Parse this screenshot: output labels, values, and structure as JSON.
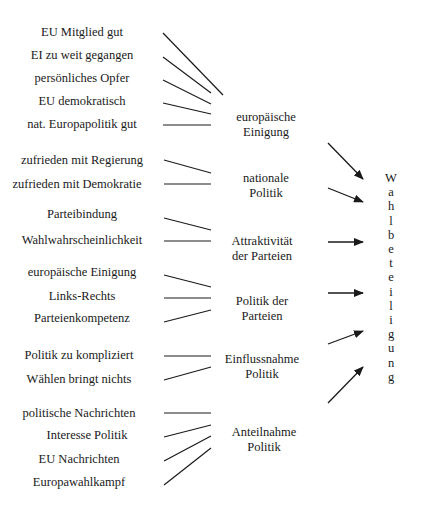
{
  "diagram": {
    "target": "Wahlbeteiligung",
    "groups": [
      {
        "label_lines": [
          "europäische",
          "Einigung"
        ],
        "label_pos": [
          266,
          110
        ],
        "factors": [
          {
            "text": "EU Mitglied gut",
            "pos": [
              82,
              32
            ],
            "line": [
              163,
              33,
              223,
              95
            ]
          },
          {
            "text": "EI zu weit gegangen",
            "pos": [
              82,
              55
            ],
            "line": [
              163,
              57,
              211,
              93
            ]
          },
          {
            "text": "persönliches Opfer",
            "pos": [
              82,
              78
            ],
            "line": [
              163,
              80,
              211,
              104
            ]
          },
          {
            "text": "EU demokratisch",
            "pos": [
              82,
              101
            ],
            "line": [
              163,
              103,
              211,
              114
            ]
          },
          {
            "text": "nat. Europapolitik gut",
            "pos": [
              82,
              124
            ],
            "line": [
              163,
              125,
              211,
              125
            ]
          }
        ],
        "arrow": [
          328,
          143,
          363,
          179
        ]
      },
      {
        "label_lines": [
          "nationale",
          "Politik"
        ],
        "label_pos": [
          266,
          171
        ],
        "factors": [
          {
            "text": "zufrieden mit Regierung",
            "pos": [
              82,
              160
            ],
            "line": [
              164,
              160,
              211,
              173
            ]
          },
          {
            "text": "zufrieden mit Demokratie",
            "pos": [
              77,
              184
            ],
            "line": [
              164,
              184,
              211,
              184
            ]
          }
        ],
        "arrow": [
          328,
          188,
          363,
          202
        ]
      },
      {
        "label_lines": [
          "Attraktivität",
          "der Parteien"
        ],
        "label_pos": [
          262,
          234
        ],
        "factors": [
          {
            "text": "Parteibindung",
            "pos": [
              82,
              214
            ],
            "line": [
              164,
              218,
              211,
              230
            ]
          },
          {
            "text": "Wahlwahrscheinlichkeit",
            "pos": [
              82,
              240
            ],
            "line": [
              164,
              241,
              211,
              241
            ]
          }
        ],
        "arrow": [
          328,
          242,
          363,
          242
        ]
      },
      {
        "label_lines": [
          "Politik der",
          "Parteien"
        ],
        "label_pos": [
          262,
          294
        ],
        "factors": [
          {
            "text": "europäische Einigung",
            "pos": [
              82,
              272
            ],
            "line": [
              164,
              275,
              211,
              287
            ]
          },
          {
            "text": "Links-Rechts",
            "pos": [
              82,
              296
            ],
            "line": [
              164,
              298,
              211,
              298
            ]
          },
          {
            "text": "Parteienkompetenz",
            "pos": [
              82,
              318
            ],
            "line": [
              164,
              322,
              211,
              310
            ]
          }
        ],
        "arrow": [
          328,
          293,
          363,
          293
        ]
      },
      {
        "label_lines": [
          "Einflussnahme",
          "Politik"
        ],
        "label_pos": [
          262,
          352
        ],
        "factors": [
          {
            "text": "Politik zu kompliziert",
            "pos": [
              79,
              355
            ],
            "line": [
              164,
              356,
              211,
              356
            ]
          },
          {
            "text": "Wählen bringt nichts",
            "pos": [
              79,
              379
            ],
            "line": [
              164,
              380,
              211,
              367
            ]
          }
        ],
        "arrow": [
          328,
          344,
          363,
          331
        ]
      },
      {
        "label_lines": [
          "Anteilnahme",
          "Politik"
        ],
        "label_pos": [
          264,
          425
        ],
        "factors": [
          {
            "text": "politische Nachrichten",
            "pos": [
              79,
              413
            ],
            "line": [
              164,
              413,
              211,
              413
            ]
          },
          {
            "text": "Interesse Politik",
            "pos": [
              87,
              435
            ],
            "line": [
              164,
              437,
              211,
              425
            ]
          },
          {
            "text": "EU Nachrichten",
            "pos": [
              79,
              459
            ],
            "line": [
              164,
              461,
              211,
              436
            ]
          },
          {
            "text": "Europawahlkampf",
            "pos": [
              79,
              482
            ],
            "line": [
              164,
              485,
              211,
              448
            ]
          }
        ],
        "arrow": [
          328,
          403,
          363,
          367
        ]
      }
    ],
    "colors": {
      "line": "#1a1a1a",
      "text": "#1a1a1a",
      "background": "#ffffff"
    }
  }
}
